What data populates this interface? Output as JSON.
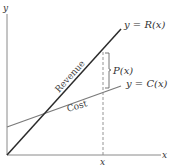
{
  "diagram": {
    "axes": {
      "x_label": "x",
      "y_label": "y",
      "x_tick_label": "x"
    },
    "lines": {
      "revenue": {
        "label": "Revenue",
        "equation": "y = R(x)",
        "color": "#2b2b2b"
      },
      "cost": {
        "label": "Cost",
        "equation": "y = C(x)",
        "color": "#7a7a7a"
      }
    },
    "profit": {
      "label": "P(x)"
    },
    "colors": {
      "axis": "#777777",
      "dashed": "#888888",
      "text": "#333333"
    }
  }
}
